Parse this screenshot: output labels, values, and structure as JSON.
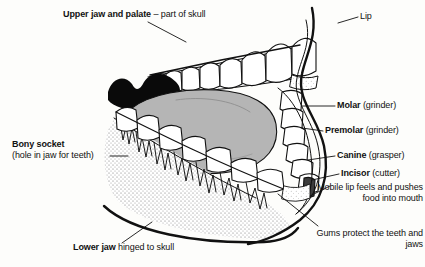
{
  "figure": {
    "background_color": "#fdfdfb",
    "ink_color": "#111111",
    "tongue_color": "#b5b5b5",
    "palate_shadow_color": "#000000",
    "bone_stipple_color": "#777777"
  },
  "labels": {
    "upper_jaw": {
      "bold": "Upper jaw and palate",
      "rest": " – part of skull"
    },
    "lip": {
      "bold": "",
      "rest": "Lip"
    },
    "molar": {
      "bold": "Molar",
      "rest": " (grinder)"
    },
    "premolar": {
      "bold": "Premolar",
      "rest": " (grinder)"
    },
    "canine": {
      "bold": "Canine",
      "rest": " (grasper)"
    },
    "incisor": {
      "bold": "Incisor",
      "rest": " (cutter)"
    },
    "mobile_lip": {
      "bold": "",
      "rest": "Mobile lip feels and pushes food into mouth"
    },
    "gums": {
      "bold": "",
      "rest": "Gums protect the teeth and jaws"
    },
    "bony_socket": {
      "bold": "Bony socket",
      "rest": "(hole in jaw for teeth)"
    },
    "lower_jaw": {
      "bold": "Lower jaw",
      "rest": " hinged to skull"
    }
  },
  "anatomy_parts": [
    "upper-dental-arch",
    "lower-dental-arch",
    "tongue",
    "soft-palate",
    "lip-outline",
    "mandible-bone",
    "tooth-roots",
    "gum-line"
  ]
}
